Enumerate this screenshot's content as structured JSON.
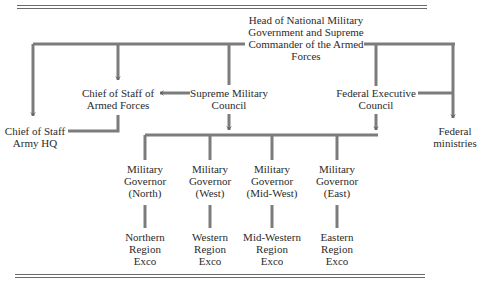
{
  "diagram": {
    "type": "organizational-chart",
    "nodes": {
      "head": [
        "Head of National Military",
        "Government and Supreme",
        "Commander of the Armed",
        "Forces"
      ],
      "cos_armed": [
        "Chief of Staff of",
        "Armed Forces"
      ],
      "smc": [
        "Supreme Military",
        "Council"
      ],
      "fec": [
        "Federal Executive",
        "Council"
      ],
      "cos_army": [
        "Chief of Staff",
        "Army HQ"
      ],
      "fed_min": [
        "Federal",
        "ministries"
      ],
      "gov_north": [
        "Military",
        "Governor",
        "(North)"
      ],
      "gov_west": [
        "Military",
        "Governor",
        "(West)"
      ],
      "gov_midwest": [
        "Military",
        "Governor",
        "(Mid-West)"
      ],
      "gov_east": [
        "Military",
        "Governor",
        "(East)"
      ],
      "exco_north": [
        "Northern",
        "Region",
        "Exco"
      ],
      "exco_west": [
        "Western",
        "Region",
        "Exco"
      ],
      "exco_midwest": [
        "Mid-Western",
        "Region",
        "Exco"
      ],
      "exco_east": [
        "Eastern",
        "Region",
        "Exco"
      ]
    },
    "edges": [
      {
        "from": "Head of National Military Government and Supreme Commander of the Armed Forces",
        "to": "Chief of Staff Army HQ",
        "arrow": true
      },
      {
        "from": "Head of National Military Government and Supreme Commander of the Armed Forces",
        "to": "Chief of Staff of Armed Forces",
        "arrow": true
      },
      {
        "from": "Head of National Military Government and Supreme Commander of the Armed Forces",
        "to": "Supreme Military Council",
        "arrow": false
      },
      {
        "from": "Head of National Military Government and Supreme Commander of the Armed Forces",
        "to": "Federal Executive Council",
        "arrow": false
      },
      {
        "from": "Head of National Military Government and Supreme Commander of the Armed Forces",
        "to": "Federal ministries",
        "arrow": true
      },
      {
        "from": "Supreme Military Council",
        "to": "Chief of Staff of Armed Forces",
        "arrow": true
      },
      {
        "from": "Chief of Staff of Armed Forces",
        "to": "Chief of Staff Army HQ",
        "arrow": false
      },
      {
        "from": "Federal Executive Council",
        "to": "Federal ministries",
        "arrow": false
      },
      {
        "from": "Supreme Military Council",
        "to": "Military Governors",
        "arrow": true
      },
      {
        "from": "Federal Executive Council",
        "to": "Military Governors",
        "arrow": true
      },
      {
        "from": "Military Governor (North)",
        "to": "Northern Region Exco",
        "arrow": false
      },
      {
        "from": "Military Governor (West)",
        "to": "Western Region Exco",
        "arrow": false
      },
      {
        "from": "Military Governor (Mid-West)",
        "to": "Mid-Western Region Exco",
        "arrow": false
      },
      {
        "from": "Military Governor (East)",
        "to": "Eastern Region Exco",
        "arrow": false
      }
    ]
  },
  "colors": {
    "line": "#7a7a7a",
    "line_dark": "#5a5a5a",
    "text": "#2b2b2b",
    "background": "#ffffff"
  }
}
